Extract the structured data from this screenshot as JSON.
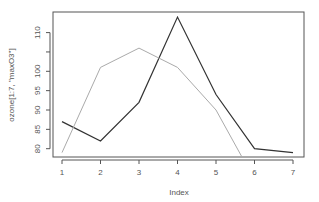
{
  "chart_data": {
    "type": "line",
    "title": "",
    "xlabel": "Index",
    "ylabel": "ozone[1:7, \"maxO3\"]",
    "x": [
      1,
      2,
      3,
      4,
      5,
      6,
      7
    ],
    "xticks": [
      "1",
      "2",
      "3",
      "4",
      "5",
      "6",
      "7"
    ],
    "yticks": [
      80,
      85,
      90,
      95,
      100,
      105,
      110
    ],
    "ytick_labels": [
      "80",
      "85",
      "90",
      "95",
      "100",
      "",
      "110"
    ],
    "ylim": [
      77.7,
      115.4
    ],
    "xlim": [
      0.76,
      7.24
    ],
    "grid": false,
    "legend": null,
    "series": [
      {
        "name": "maxO3",
        "color": "#333333",
        "values": [
          87,
          82,
          92,
          114,
          94,
          80,
          79
        ]
      },
      {
        "name": "added line",
        "color": "#aaaaaa",
        "values": [
          79,
          101,
          106,
          101,
          90,
          72,
          null
        ]
      }
    ]
  },
  "colors": {
    "axis": "#555555",
    "box": "#555555",
    "text": "#555555"
  }
}
